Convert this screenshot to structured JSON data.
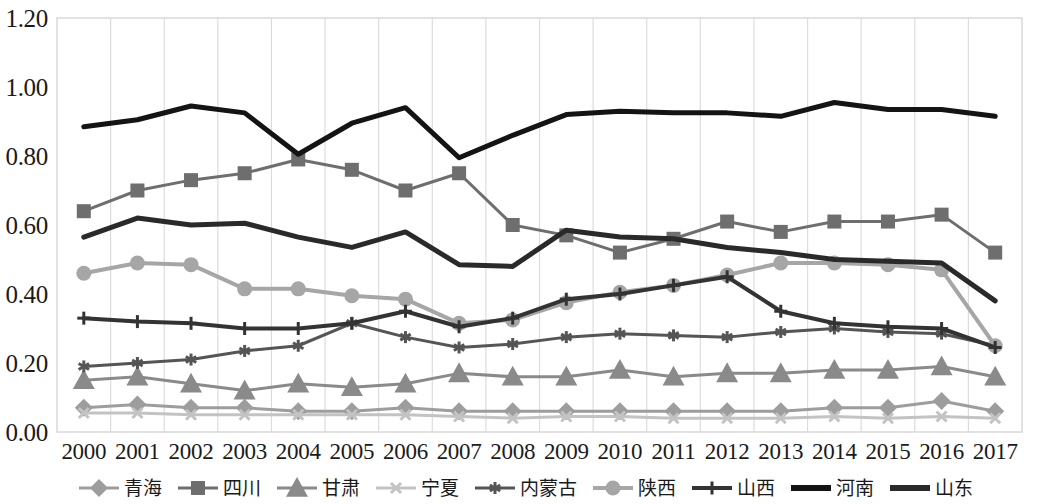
{
  "chart_data": {
    "type": "line",
    "title": "",
    "subtitle": "",
    "xlabel": "",
    "ylabel": "",
    "grid": "vertical",
    "legend_position": "bottom",
    "ylim": [
      0.0,
      1.2
    ],
    "ytick_labels": [
      "0.00",
      "0.20",
      "0.40",
      "0.60",
      "0.80",
      "1.00",
      "1.20"
    ],
    "ytick_values": [
      0.0,
      0.2,
      0.4,
      0.6,
      0.8,
      1.0,
      1.2
    ],
    "categories": [
      "2000",
      "2001",
      "2002",
      "2003",
      "2004",
      "2005",
      "2006",
      "2007",
      "2008",
      "2009",
      "2010",
      "2011",
      "2012",
      "2013",
      "2014",
      "2015",
      "2016",
      "2017"
    ],
    "series": [
      {
        "name": "青海",
        "marker": "diamond",
        "color": "#9d9d9d",
        "line_width": 3,
        "marker_size": 9,
        "values": [
          0.07,
          0.08,
          0.07,
          0.07,
          0.06,
          0.06,
          0.07,
          0.06,
          0.06,
          0.06,
          0.06,
          0.06,
          0.06,
          0.06,
          0.07,
          0.07,
          0.09,
          0.06
        ]
      },
      {
        "name": "四川",
        "marker": "square",
        "color": "#6e6e6e",
        "line_width": 3,
        "marker_size": 14,
        "values": [
          0.64,
          0.7,
          0.73,
          0.75,
          0.79,
          0.76,
          0.7,
          0.75,
          0.6,
          0.57,
          0.52,
          0.56,
          0.61,
          0.58,
          0.61,
          0.61,
          0.63,
          0.52
        ]
      },
      {
        "name": "甘肃",
        "marker": "triangle",
        "color": "#8a8a8a",
        "line_width": 3,
        "marker_size": 11,
        "values": [
          0.15,
          0.16,
          0.14,
          0.12,
          0.14,
          0.13,
          0.14,
          0.17,
          0.16,
          0.16,
          0.18,
          0.16,
          0.17,
          0.17,
          0.18,
          0.18,
          0.19,
          0.16
        ]
      },
      {
        "name": "宁夏",
        "marker": "x",
        "color": "#c3c3c3",
        "line_width": 3,
        "marker_size": 10,
        "values": [
          0.055,
          0.055,
          0.05,
          0.05,
          0.05,
          0.05,
          0.05,
          0.045,
          0.04,
          0.045,
          0.045,
          0.04,
          0.04,
          0.04,
          0.045,
          0.04,
          0.045,
          0.04
        ]
      },
      {
        "name": "内蒙古",
        "marker": "asterisk",
        "color": "#555555",
        "line_width": 3,
        "marker_size": 12,
        "values": [
          0.19,
          0.2,
          0.21,
          0.235,
          0.25,
          0.315,
          0.275,
          0.245,
          0.255,
          0.275,
          0.285,
          0.28,
          0.275,
          0.29,
          0.3,
          0.29,
          0.285,
          0.25
        ]
      },
      {
        "name": "陕西",
        "marker": "circle",
        "color": "#a6a6a6",
        "line_width": 4,
        "marker_size": 11,
        "values": [
          0.46,
          0.49,
          0.485,
          0.415,
          0.415,
          0.395,
          0.385,
          0.315,
          0.325,
          0.375,
          0.405,
          0.425,
          0.455,
          0.49,
          0.49,
          0.485,
          0.47,
          0.25
        ]
      },
      {
        "name": "山西",
        "marker": "plus",
        "color": "#333333",
        "line_width": 4,
        "marker_size": 13,
        "values": [
          0.33,
          0.32,
          0.315,
          0.3,
          0.3,
          0.315,
          0.35,
          0.305,
          0.33,
          0.385,
          0.4,
          0.425,
          0.45,
          0.35,
          0.315,
          0.305,
          0.3,
          0.245
        ]
      },
      {
        "name": "河南",
        "marker": "none",
        "color": "#141414",
        "line_width": 5,
        "marker_size": 0,
        "values": [
          0.885,
          0.905,
          0.945,
          0.925,
          0.805,
          0.895,
          0.94,
          0.795,
          0.86,
          0.92,
          0.93,
          0.925,
          0.925,
          0.915,
          0.955,
          0.935,
          0.935,
          0.915
        ]
      },
      {
        "name": "山东",
        "marker": "none",
        "color": "#2a2a2a",
        "line_width": 5,
        "marker_size": 0,
        "values": [
          0.565,
          0.62,
          0.6,
          0.605,
          0.565,
          0.535,
          0.58,
          0.485,
          0.48,
          0.585,
          0.565,
          0.56,
          0.535,
          0.52,
          0.5,
          0.495,
          0.49,
          0.38
        ]
      }
    ]
  },
  "axes": {
    "plot_left": 57,
    "plot_right": 1022,
    "plot_top": 18,
    "plot_bottom": 432,
    "border_color": "#d9d9d9",
    "gridline_color": "#dcdcdc"
  },
  "legend": {
    "items": [
      {
        "label": "青海",
        "key": "diamond"
      },
      {
        "label": "四川",
        "key": "square"
      },
      {
        "label": "甘肃",
        "key": "triangle"
      },
      {
        "label": "宁夏",
        "key": "x"
      },
      {
        "label": "内蒙古",
        "key": "asterisk"
      },
      {
        "label": "陕西",
        "key": "circle"
      },
      {
        "label": "山西",
        "key": "plus"
      },
      {
        "label": "河南",
        "key": "line"
      },
      {
        "label": "山东",
        "key": "line"
      }
    ]
  }
}
